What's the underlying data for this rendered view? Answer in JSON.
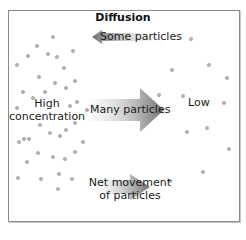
{
  "title": "Diffusion",
  "labels": {
    "some_particles": "Some particles",
    "many_particles": "Many particles",
    "high_line1": "High",
    "high_line2": "concentration",
    "low": "Low",
    "net_line1": "Net movement",
    "net_line2": "of particles"
  },
  "arrows": [
    {
      "name": "some-particles-arrow",
      "direction": "left",
      "size": "small"
    },
    {
      "name": "many-particles-arrow",
      "direction": "right",
      "size": "large"
    },
    {
      "name": "net-movement-arrow",
      "direction": "right",
      "size": "medium"
    }
  ],
  "colors": {
    "particle_fill": "#b8b8b8",
    "particle_stroke": "#8f8f8f",
    "arrow_dark": "#6e6e6e",
    "arrow_light": "#f2f2f2",
    "border": "#8a8a8a"
  },
  "particles": {
    "high_side": [
      [
        53,
        37
      ],
      [
        37,
        46
      ],
      [
        28,
        56
      ],
      [
        48,
        54
      ],
      [
        57,
        57
      ],
      [
        73,
        51
      ],
      [
        17,
        65
      ],
      [
        64,
        68
      ],
      [
        39,
        77
      ],
      [
        55,
        83
      ],
      [
        75,
        81
      ],
      [
        66,
        88
      ],
      [
        23,
        92
      ],
      [
        45,
        92
      ],
      [
        33,
        98
      ],
      [
        17,
        108
      ],
      [
        70,
        106
      ],
      [
        77,
        102
      ],
      [
        87,
        110
      ],
      [
        40,
        125
      ],
      [
        75,
        123
      ],
      [
        66,
        130
      ],
      [
        50,
        133
      ],
      [
        60,
        136
      ],
      [
        24,
        139
      ],
      [
        29,
        139
      ],
      [
        19,
        142
      ],
      [
        83,
        142
      ],
      [
        38,
        153
      ],
      [
        75,
        152
      ],
      [
        53,
        157
      ],
      [
        65,
        159
      ],
      [
        27,
        162
      ],
      [
        59,
        174
      ],
      [
        18,
        178
      ],
      [
        41,
        179
      ],
      [
        72,
        179
      ],
      [
        58,
        189
      ]
    ],
    "low_side": [
      [
        191,
        39
      ],
      [
        209,
        65
      ],
      [
        172,
        70
      ],
      [
        227,
        78
      ],
      [
        159,
        95
      ],
      [
        183,
        96
      ],
      [
        224,
        103
      ],
      [
        207,
        128
      ],
      [
        187,
        132
      ],
      [
        229,
        149
      ],
      [
        203,
        172
      ],
      [
        170,
        181
      ]
    ]
  }
}
